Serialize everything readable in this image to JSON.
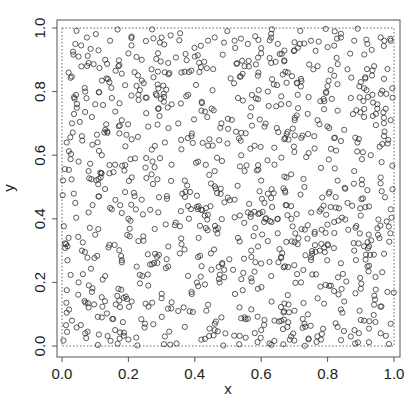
{
  "chart_data": {
    "type": "scatter",
    "title": "",
    "xlabel": "x",
    "ylabel": "y",
    "xlim": [
      0.0,
      1.0
    ],
    "ylim": [
      0.0,
      1.0
    ],
    "x_ticks": [
      "0.0",
      "0.2",
      "0.4",
      "0.6",
      "0.8",
      "1.0"
    ],
    "y_ticks": [
      "0.0",
      "0.2",
      "0.4",
      "0.6",
      "0.8",
      "1.0"
    ],
    "grid": false,
    "legend": null,
    "marker": "open-circle",
    "marker_color": "#333333",
    "bounding_rect": {
      "x0": 0.0,
      "y0": 0.0,
      "x1": 1.0,
      "y1": 1.0,
      "style": "dotted"
    },
    "distribution": "uniform random on unit square",
    "n_points_approx": 1000,
    "sample_points": [
      [
        0.04,
        0.95
      ],
      [
        0.075,
        0.97
      ],
      [
        0.145,
        0.96
      ],
      [
        0.3,
        0.97
      ],
      [
        0.44,
        0.96
      ],
      [
        0.46,
        0.97
      ],
      [
        0.02,
        0.86
      ],
      [
        0.05,
        0.91
      ],
      [
        0.08,
        0.89
      ],
      [
        0.11,
        0.93
      ],
      [
        0.13,
        0.9
      ],
      [
        0.17,
        0.88
      ],
      [
        0.2,
        0.92
      ],
      [
        0.24,
        0.9
      ],
      [
        0.27,
        0.87
      ],
      [
        0.32,
        0.89
      ],
      [
        0.36,
        0.86
      ],
      [
        0.4,
        0.91
      ],
      [
        0.07,
        0.8
      ],
      [
        0.1,
        0.76
      ],
      [
        0.15,
        0.78
      ],
      [
        0.19,
        0.82
      ],
      [
        0.23,
        0.79
      ],
      [
        0.29,
        0.81
      ],
      [
        0.33,
        0.76
      ],
      [
        0.38,
        0.79
      ],
      [
        0.42,
        0.74
      ],
      [
        0.03,
        0.7
      ],
      [
        0.06,
        0.66
      ],
      [
        0.09,
        0.72
      ],
      [
        0.13,
        0.68
      ],
      [
        0.18,
        0.71
      ],
      [
        0.21,
        0.65
      ],
      [
        0.26,
        0.69
      ],
      [
        0.31,
        0.64
      ],
      [
        0.35,
        0.7
      ],
      [
        0.39,
        0.66
      ],
      [
        0.44,
        0.63
      ],
      [
        0.48,
        0.7
      ],
      [
        0.05,
        0.58
      ],
      [
        0.08,
        0.55
      ],
      [
        0.12,
        0.6
      ],
      [
        0.16,
        0.57
      ],
      [
        0.22,
        0.59
      ],
      [
        0.27,
        0.54
      ],
      [
        0.33,
        0.57
      ],
      [
        0.37,
        0.52
      ],
      [
        0.41,
        0.58
      ],
      [
        0.46,
        0.55
      ],
      [
        0.52,
        0.96
      ],
      [
        0.56,
        0.95
      ],
      [
        0.6,
        0.92
      ],
      [
        0.65,
        0.95
      ],
      [
        0.7,
        0.93
      ],
      [
        0.75,
        0.96
      ],
      [
        0.8,
        0.94
      ],
      [
        0.84,
        0.97
      ],
      [
        0.88,
        0.96
      ],
      [
        0.92,
        0.95
      ],
      [
        0.96,
        0.97
      ],
      [
        0.99,
        0.96
      ],
      [
        0.55,
        0.88
      ],
      [
        0.59,
        0.85
      ],
      [
        0.63,
        0.89
      ],
      [
        0.68,
        0.86
      ],
      [
        0.72,
        0.84
      ],
      [
        0.77,
        0.88
      ],
      [
        0.82,
        0.85
      ],
      [
        0.86,
        0.87
      ],
      [
        0.9,
        0.83
      ],
      [
        0.94,
        0.88
      ],
      [
        0.97,
        0.84
      ],
      [
        0.53,
        0.78
      ],
      [
        0.57,
        0.75
      ],
      [
        0.62,
        0.8
      ],
      [
        0.66,
        0.76
      ],
      [
        0.71,
        0.79
      ],
      [
        0.74,
        0.73
      ],
      [
        0.79,
        0.77
      ],
      [
        0.83,
        0.74
      ],
      [
        0.87,
        0.78
      ],
      [
        0.91,
        0.72
      ],
      [
        0.95,
        0.76
      ],
      [
        0.99,
        0.71
      ],
      [
        0.54,
        0.67
      ],
      [
        0.58,
        0.63
      ],
      [
        0.61,
        0.69
      ],
      [
        0.67,
        0.65
      ],
      [
        0.7,
        0.61
      ],
      [
        0.76,
        0.66
      ],
      [
        0.81,
        0.62
      ],
      [
        0.85,
        0.68
      ],
      [
        0.89,
        0.64
      ],
      [
        0.93,
        0.6
      ],
      [
        0.97,
        0.66
      ],
      [
        0.55,
        0.55
      ],
      [
        0.6,
        0.52
      ],
      [
        0.64,
        0.57
      ],
      [
        0.69,
        0.54
      ],
      [
        0.73,
        0.5
      ],
      [
        0.78,
        0.56
      ],
      [
        0.83,
        0.52
      ],
      [
        0.88,
        0.55
      ],
      [
        0.92,
        0.49
      ],
      [
        0.96,
        0.53
      ],
      [
        0.04,
        0.45
      ],
      [
        0.08,
        0.42
      ],
      [
        0.11,
        0.47
      ],
      [
        0.15,
        0.43
      ],
      [
        0.2,
        0.4
      ],
      [
        0.24,
        0.46
      ],
      [
        0.29,
        0.42
      ],
      [
        0.34,
        0.38
      ],
      [
        0.38,
        0.44
      ],
      [
        0.43,
        0.41
      ],
      [
        0.47,
        0.37
      ],
      [
        0.02,
        0.34
      ],
      [
        0.06,
        0.3
      ],
      [
        0.1,
        0.35
      ],
      [
        0.14,
        0.31
      ],
      [
        0.18,
        0.27
      ],
      [
        0.23,
        0.33
      ],
      [
        0.28,
        0.29
      ],
      [
        0.32,
        0.25
      ],
      [
        0.36,
        0.32
      ],
      [
        0.41,
        0.28
      ],
      [
        0.45,
        0.24
      ],
      [
        0.05,
        0.2
      ],
      [
        0.09,
        0.17
      ],
      [
        0.13,
        0.22
      ],
      [
        0.17,
        0.18
      ],
      [
        0.21,
        0.14
      ],
      [
        0.26,
        0.19
      ],
      [
        0.3,
        0.15
      ],
      [
        0.35,
        0.11
      ],
      [
        0.39,
        0.17
      ],
      [
        0.44,
        0.13
      ],
      [
        0.48,
        0.09
      ],
      [
        0.03,
        0.08
      ],
      [
        0.07,
        0.04
      ],
      [
        0.12,
        0.09
      ],
      [
        0.16,
        0.05
      ],
      [
        0.2,
        0.02
      ],
      [
        0.25,
        0.07
      ],
      [
        0.31,
        0.03
      ],
      [
        0.37,
        0.06
      ],
      [
        0.42,
        0.02
      ],
      [
        0.46,
        0.05
      ],
      [
        0.52,
        0.46
      ],
      [
        0.56,
        0.42
      ],
      [
        0.61,
        0.45
      ],
      [
        0.65,
        0.4
      ],
      [
        0.69,
        0.44
      ],
      [
        0.74,
        0.38
      ],
      [
        0.78,
        0.43
      ],
      [
        0.82,
        0.39
      ],
      [
        0.86,
        0.45
      ],
      [
        0.9,
        0.41
      ],
      [
        0.95,
        0.37
      ],
      [
        0.99,
        0.43
      ],
      [
        0.53,
        0.34
      ],
      [
        0.57,
        0.3
      ],
      [
        0.62,
        0.33
      ],
      [
        0.66,
        0.28
      ],
      [
        0.71,
        0.32
      ],
      [
        0.75,
        0.27
      ],
      [
        0.79,
        0.31
      ],
      [
        0.84,
        0.26
      ],
      [
        0.88,
        0.3
      ],
      [
        0.92,
        0.25
      ],
      [
        0.97,
        0.29
      ],
      [
        0.54,
        0.21
      ],
      [
        0.59,
        0.18
      ],
      [
        0.63,
        0.22
      ],
      [
        0.68,
        0.16
      ],
      [
        0.72,
        0.2
      ],
      [
        0.77,
        0.15
      ],
      [
        0.81,
        0.19
      ],
      [
        0.85,
        0.14
      ],
      [
        0.9,
        0.18
      ],
      [
        0.94,
        0.13
      ],
      [
        0.98,
        0.17
      ],
      [
        0.55,
        0.09
      ],
      [
        0.6,
        0.05
      ],
      [
        0.64,
        0.08
      ],
      [
        0.69,
        0.03
      ],
      [
        0.73,
        0.07
      ],
      [
        0.78,
        0.02
      ],
      [
        0.83,
        0.06
      ],
      [
        0.87,
        0.03
      ],
      [
        0.91,
        0.08
      ],
      [
        0.96,
        0.04
      ],
      [
        0.99,
        0.07
      ]
    ]
  },
  "plot": {
    "x_axis_label": "x",
    "y_axis_label": "y"
  }
}
